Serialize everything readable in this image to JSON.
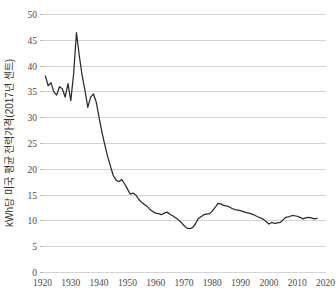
{
  "chart_data": {
    "type": "line",
    "title": "",
    "subtitle": "",
    "xlabel": "",
    "ylabel": "kWh당 미국 평균 전력가격(2017년 센트)",
    "xlim": [
      1920,
      2020
    ],
    "ylim": [
      0,
      50
    ],
    "grid": "horizontal",
    "legend": "none",
    "x_ticks": [
      "1920",
      "1930",
      "1940",
      "1950",
      "1960",
      "1970",
      "1980",
      "1990",
      "2000",
      "2010",
      "2020"
    ],
    "y_ticks": [
      "0",
      "5",
      "10",
      "15",
      "20",
      "25",
      "30",
      "35",
      "40",
      "45",
      "50"
    ],
    "x_tick_interval": 10,
    "y_tick_interval": 5,
    "line_color": "#2b2b2b",
    "gridline_color": "#c9c9c9",
    "background_color": "#ffffff",
    "series": [
      {
        "name": "kWh당 미국 평균 전력가격(2017년 센트)",
        "x": [
          1921,
          1922,
          1923,
          1924,
          1925,
          1926,
          1927,
          1928,
          1929,
          1930,
          1931,
          1932,
          1933,
          1934,
          1935,
          1936,
          1937,
          1938,
          1939,
          1940,
          1941,
          1942,
          1943,
          1944,
          1945,
          1946,
          1947,
          1948,
          1949,
          1950,
          1951,
          1952,
          1953,
          1954,
          1955,
          1956,
          1957,
          1958,
          1959,
          1960,
          1961,
          1962,
          1963,
          1964,
          1965,
          1966,
          1967,
          1968,
          1969,
          1970,
          1971,
          1972,
          1973,
          1974,
          1975,
          1976,
          1977,
          1978,
          1979,
          1980,
          1981,
          1982,
          1983,
          1984,
          1985,
          1986,
          1987,
          1988,
          1989,
          1990,
          1991,
          1992,
          1993,
          1994,
          1995,
          1996,
          1997,
          1998,
          1999,
          2000,
          2001,
          2002,
          2003,
          2004,
          2005,
          2006,
          2007,
          2008,
          2009,
          2010,
          2011,
          2012,
          2013,
          2014,
          2015,
          2016,
          2017
        ],
        "values": [
          38.1,
          36.2,
          36.8,
          35.0,
          34.4,
          36.0,
          35.6,
          34.0,
          36.6,
          33.3,
          38.5,
          46.5,
          42.0,
          38.2,
          35.3,
          32.0,
          34.0,
          34.6,
          33.0,
          30.0,
          27.2,
          24.8,
          22.5,
          20.6,
          18.8,
          17.9,
          17.6,
          18.0,
          17.2,
          16.2,
          15.2,
          15.4,
          15.0,
          14.2,
          13.6,
          13.2,
          12.8,
          12.2,
          11.8,
          11.5,
          11.4,
          11.2,
          11.5,
          11.7,
          11.3,
          11.0,
          10.6,
          10.2,
          9.7,
          9.1,
          8.6,
          8.5,
          8.7,
          9.4,
          10.4,
          10.8,
          11.2,
          11.3,
          11.4,
          11.9,
          12.6,
          13.4,
          13.3,
          13.0,
          12.9,
          12.7,
          12.4,
          12.2,
          12.1,
          12.0,
          11.8,
          11.6,
          11.5,
          11.3,
          11.1,
          10.8,
          10.6,
          10.3,
          9.9,
          9.4,
          9.7,
          9.5,
          9.6,
          9.7,
          10.2,
          10.7,
          10.8,
          11.0,
          11.0,
          10.9,
          10.7,
          10.4,
          10.6,
          10.7,
          10.6,
          10.4,
          10.5
        ]
      }
    ]
  }
}
